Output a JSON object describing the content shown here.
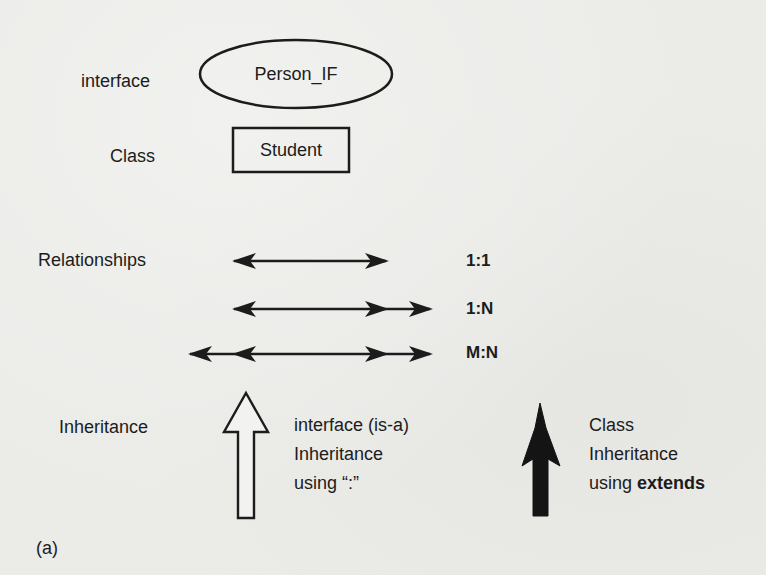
{
  "diagram": {
    "legend": {
      "interface": {
        "label": "interface",
        "shape": "ellipse",
        "example": "Person_IF"
      },
      "class": {
        "label": "Class",
        "shape": "rectangle",
        "example": "Student"
      },
      "relationships": {
        "label": "Relationships",
        "items": [
          {
            "cardinality": "1:1",
            "arrow": "double-headed"
          },
          {
            "cardinality": "1:N",
            "arrow": "single-left, double-right"
          },
          {
            "cardinality": "M:N",
            "arrow": "double-left, double-right"
          }
        ]
      },
      "inheritance": {
        "label": "Inheritance",
        "interface_inheritance": {
          "arrow": "hollow-up-arrow",
          "line1": "interface (is-a)",
          "line2": "Inheritance",
          "line3": "using “:”"
        },
        "class_inheritance": {
          "arrow": "filled-up-arrow",
          "line1": "Class",
          "line2": "Inheritance",
          "line3_prefix": "using ",
          "line3_keyword": "extends"
        }
      }
    },
    "caption": "(a)",
    "colors": {
      "background": "#ebebe8",
      "ink": "#1c1c1c"
    }
  }
}
